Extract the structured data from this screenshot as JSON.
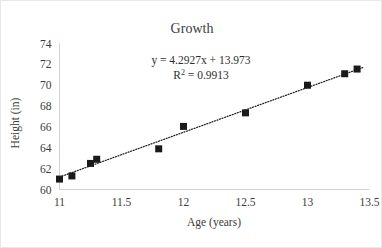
{
  "chart_data": {
    "type": "scatter",
    "title": "Growth",
    "xlabel": "Age (years)",
    "ylabel": "Height (in)",
    "xlim": [
      11,
      13.5
    ],
    "ylim": [
      60,
      74
    ],
    "xticks": [
      "11",
      "11.5",
      "12",
      "12.5",
      "13",
      "13.5"
    ],
    "yticks": [
      "60",
      "62",
      "64",
      "66",
      "68",
      "70",
      "72",
      "74"
    ],
    "grid": false,
    "legend": "none",
    "marker": "square",
    "marker_color": "#1a1a1a",
    "trendline": {
      "style": "dotted",
      "color": "#1a1a1a",
      "slope": 4.2927,
      "intercept": 13.973,
      "r_squared": 0.9913,
      "equation_label": "y = 4.2927x + 13.973",
      "r2_label_prefix": "R",
      "r2_label_sup": "2",
      "r2_label_value": " = 0.9913"
    },
    "x": [
      11.0,
      11.1,
      11.25,
      11.3,
      11.8,
      12.0,
      12.5,
      13.0,
      13.3,
      13.4
    ],
    "y": [
      61.0,
      61.3,
      62.5,
      62.9,
      63.9,
      66.05,
      67.35,
      70.0,
      71.1,
      71.55
    ],
    "points": [
      {
        "x": 11.0,
        "y": 61.0
      },
      {
        "x": 11.1,
        "y": 61.3
      },
      {
        "x": 11.25,
        "y": 62.5
      },
      {
        "x": 11.3,
        "y": 62.9
      },
      {
        "x": 11.8,
        "y": 63.9
      },
      {
        "x": 12.0,
        "y": 66.05
      },
      {
        "x": 12.5,
        "y": 67.35
      },
      {
        "x": 13.0,
        "y": 70.0
      },
      {
        "x": 13.3,
        "y": 71.1
      },
      {
        "x": 13.4,
        "y": 71.55
      }
    ]
  }
}
